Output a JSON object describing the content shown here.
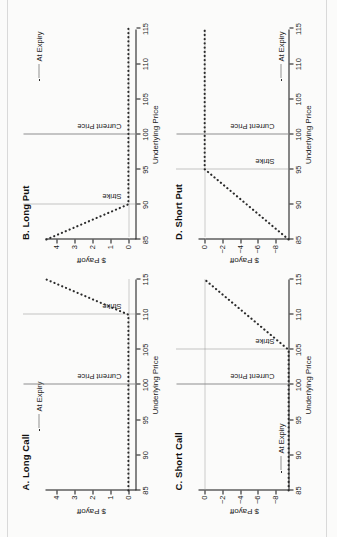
{
  "figure": {
    "axis_x_label": "Underlying Price",
    "axis_y_label": "$ Payoff",
    "legend_label": "At Expiry",
    "current_price_label": "Current Price",
    "strike_label": "Strike",
    "x_ticks": [
      "85",
      "90",
      "95",
      "100",
      "105",
      "110",
      "115"
    ],
    "accent_line_color": "#2b2b2b",
    "reference_line_color": "#8d8d8d"
  },
  "chart_data": [
    {
      "type": "line",
      "panel_id": "A",
      "title": "A. Long Call",
      "xlabel": "Underlying Price",
      "ylabel": "$ Payoff",
      "xlim": [
        85,
        115
      ],
      "ylim": [
        -0.45,
        4.6
      ],
      "x_ticks": [
        85,
        90,
        95,
        100,
        105,
        110,
        115
      ],
      "y_ticks": [
        0,
        1,
        2,
        3,
        4
      ],
      "y_tick_labels": [
        "0",
        "1",
        "2",
        "3",
        "4"
      ],
      "grid": false,
      "legend": "At Expiry",
      "legend_position": "top-left",
      "strike": 110,
      "current_price": 100,
      "series": [
        {
          "name": "At Expiry",
          "style": "dotted",
          "x": [
            85,
            110,
            115
          ],
          "values": [
            0,
            0,
            4.55
          ]
        }
      ],
      "annotations": [
        "Current Price",
        "Strike"
      ]
    },
    {
      "type": "line",
      "panel_id": "B",
      "title": "B. Long Put",
      "xlabel": "Underlying Price",
      "ylabel": "$ Payoff",
      "xlim": [
        85,
        115
      ],
      "ylim": [
        -0.45,
        4.6
      ],
      "x_ticks": [
        85,
        90,
        95,
        100,
        105,
        110,
        115
      ],
      "y_ticks": [
        0,
        1,
        2,
        3,
        4
      ],
      "y_tick_labels": [
        "0",
        "1",
        "2",
        "3",
        "4"
      ],
      "grid": false,
      "legend": "At Expiry",
      "legend_position": "top-right",
      "strike": 90,
      "current_price": 100,
      "series": [
        {
          "name": "At Expiry",
          "style": "dotted",
          "x": [
            85,
            90,
            115
          ],
          "values": [
            4.55,
            0,
            0
          ]
        }
      ],
      "annotations": [
        "Current Price",
        "Strike"
      ]
    },
    {
      "type": "line",
      "panel_id": "C",
      "title": "C. Short Call",
      "xlabel": "Underlying Price",
      "ylabel": "$ Payoff",
      "xlim": [
        85,
        115
      ],
      "ylim": [
        -9.6,
        0.7
      ],
      "x_ticks": [
        85,
        90,
        95,
        100,
        105,
        110,
        115
      ],
      "y_ticks": [
        0,
        -2,
        -4,
        -6,
        -8
      ],
      "y_tick_labels": [
        "0",
        "−2",
        "−4",
        "−6",
        "−8"
      ],
      "grid": false,
      "legend": "At Expiry",
      "legend_position": "bottom-left",
      "strike": 105,
      "current_price": 100,
      "series": [
        {
          "name": "At Expiry",
          "style": "dotted",
          "x": [
            85,
            105,
            115
          ],
          "values": [
            -9.5,
            -9.5,
            0
          ]
        }
      ],
      "annotations": [
        "Current Price",
        "Strike"
      ]
    },
    {
      "type": "line",
      "panel_id": "D",
      "title": "D. Short Put",
      "xlabel": "Underlying Price",
      "ylabel": "$ Payoff",
      "xlim": [
        85,
        115
      ],
      "ylim": [
        -9.6,
        0.7
      ],
      "x_ticks": [
        85,
        90,
        95,
        100,
        105,
        110,
        115
      ],
      "y_ticks": [
        0,
        -2,
        -4,
        -6,
        -8
      ],
      "y_tick_labels": [
        "0",
        "−2",
        "−4",
        "−6",
        "−8"
      ],
      "grid": false,
      "legend": "At Expiry",
      "legend_position": "bottom-right",
      "strike": 95,
      "current_price": 100,
      "series": [
        {
          "name": "At Expiry",
          "style": "dotted",
          "x": [
            85,
            95,
            115
          ],
          "values": [
            -9.5,
            0,
            0
          ]
        }
      ],
      "annotations": [
        "Current Price",
        "Strike"
      ]
    }
  ]
}
